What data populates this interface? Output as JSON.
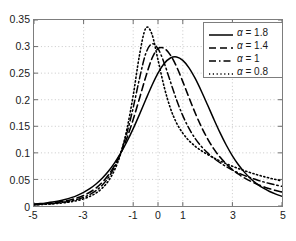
{
  "chart_data": {
    "type": "line",
    "title": "",
    "xlabel": "",
    "ylabel": "",
    "xlim": [
      -5,
      5
    ],
    "ylim": [
      0,
      0.35
    ],
    "grid": true,
    "legend_position": "top-right",
    "x_ticks": [
      "-5",
      "-3",
      "-1",
      "0",
      "1",
      "3",
      "5"
    ],
    "x_tick_values": [
      -5,
      -3,
      -1,
      0,
      1,
      3,
      5
    ],
    "y_ticks": [
      "0",
      "0.05",
      "0.1",
      "0.15",
      "0.2",
      "0.25",
      "0.3",
      "0.35"
    ],
    "y_tick_values": [
      0,
      0.05,
      0.1,
      0.15,
      0.2,
      0.25,
      0.3,
      0.35
    ],
    "series": [
      {
        "name": "α = 1.8",
        "legend_label": "α = 1.8",
        "alpha": 1.8,
        "style": "solid",
        "color": "#000000",
        "peak_x": 0.0,
        "peak_y": 0.283,
        "x": [
          -5,
          -4.75,
          -4.5,
          -4.25,
          -4,
          -3.75,
          -3.5,
          -3.25,
          -3,
          -2.75,
          -2.5,
          -2.25,
          -2,
          -1.75,
          -1.5,
          -1.25,
          -1,
          -0.75,
          -0.5,
          -0.25,
          0,
          0.25,
          0.5,
          0.75,
          1,
          1.25,
          1.5,
          1.75,
          2,
          2.25,
          2.5,
          2.75,
          3,
          3.25,
          3.5,
          3.75,
          4,
          4.25,
          4.5,
          4.75,
          5
        ],
        "y": [
          0.0035,
          0.0045,
          0.0058,
          0.0074,
          0.0095,
          0.0122,
          0.0157,
          0.0201,
          0.0257,
          0.0327,
          0.0415,
          0.0523,
          0.0655,
          0.0813,
          0.0999,
          0.1214,
          0.1456,
          0.172,
          0.1995,
          0.2263,
          0.25,
          0.268,
          0.2785,
          0.2805,
          0.274,
          0.26,
          0.24,
          0.216,
          0.19,
          0.1635,
          0.138,
          0.1148,
          0.0945,
          0.0772,
          0.0628,
          0.0509,
          0.0413,
          0.0335,
          0.0273,
          0.0223,
          0.0183
        ]
      },
      {
        "name": "α = 1.4",
        "legend_label": "α = 1.4",
        "alpha": 1.4,
        "style": "dashed",
        "color": "#000000",
        "peak_x": -0.2,
        "peak_y": 0.3,
        "x": [
          -5,
          -4.75,
          -4.5,
          -4.25,
          -4,
          -3.75,
          -3.5,
          -3.25,
          -3,
          -2.75,
          -2.5,
          -2.25,
          -2,
          -1.75,
          -1.5,
          -1.25,
          -1,
          -0.75,
          -0.5,
          -0.25,
          0,
          0.25,
          0.5,
          0.75,
          1,
          1.25,
          1.5,
          1.75,
          2,
          2.25,
          2.5,
          2.75,
          3,
          3.25,
          3.5,
          3.75,
          4,
          4.25,
          4.5,
          4.75,
          5
        ],
        "y": [
          0.003,
          0.0037,
          0.0046,
          0.0058,
          0.0073,
          0.0093,
          0.0119,
          0.0153,
          0.0198,
          0.0258,
          0.0338,
          0.0444,
          0.0583,
          0.0764,
          0.0995,
          0.1284,
          0.163,
          0.202,
          0.242,
          0.277,
          0.296,
          0.2965,
          0.284,
          0.262,
          0.234,
          0.204,
          0.175,
          0.149,
          0.1265,
          0.1075,
          0.092,
          0.0792,
          0.0686,
          0.0598,
          0.0524,
          0.0462,
          0.0409,
          0.0364,
          0.0325,
          0.0292,
          0.0263
        ]
      },
      {
        "name": "α = 1",
        "legend_label": "α = 1",
        "alpha": 1.0,
        "style": "dashdot",
        "color": "#000000",
        "peak_x": -0.3,
        "peak_y": 0.305,
        "x": [
          -5,
          -4.75,
          -4.5,
          -4.25,
          -4,
          -3.75,
          -3.5,
          -3.25,
          -3,
          -2.75,
          -2.5,
          -2.25,
          -2,
          -1.75,
          -1.5,
          -1.25,
          -1,
          -0.75,
          -0.5,
          -0.25,
          0,
          0.25,
          0.5,
          0.75,
          1,
          1.25,
          1.5,
          1.75,
          2,
          2.25,
          2.5,
          2.75,
          3,
          3.25,
          3.5,
          3.75,
          4,
          4.25,
          4.5,
          4.75,
          5
        ],
        "y": [
          0.0026,
          0.0032,
          0.0039,
          0.0048,
          0.006,
          0.0076,
          0.0097,
          0.0125,
          0.0163,
          0.0216,
          0.0289,
          0.0392,
          0.0535,
          0.0735,
          0.101,
          0.138,
          0.185,
          0.239,
          0.286,
          0.305,
          0.296,
          0.269,
          0.234,
          0.1995,
          0.17,
          0.146,
          0.127,
          0.112,
          0.1,
          0.09,
          0.0815,
          0.0742,
          0.0678,
          0.0622,
          0.0572,
          0.0528,
          0.0489,
          0.0454,
          0.0423,
          0.0395,
          0.037
        ]
      },
      {
        "name": "α = 0.8",
        "legend_label": "α = 0.8",
        "alpha": 0.8,
        "style": "dotted",
        "color": "#000000",
        "peak_x": -0.45,
        "peak_y": 0.335,
        "x": [
          -5,
          -4.75,
          -4.5,
          -4.25,
          -4,
          -3.75,
          -3.5,
          -3.25,
          -3,
          -2.75,
          -2.5,
          -2.25,
          -2,
          -1.75,
          -1.5,
          -1.25,
          -1,
          -0.75,
          -0.5,
          -0.25,
          0,
          0.25,
          0.5,
          0.75,
          1,
          1.25,
          1.5,
          1.75,
          2,
          2.25,
          2.5,
          2.75,
          3,
          3.25,
          3.5,
          3.75,
          4,
          4.25,
          4.5,
          4.75,
          5
        ],
        "y": [
          0.0022,
          0.0027,
          0.0033,
          0.004,
          0.005,
          0.0063,
          0.008,
          0.0103,
          0.0135,
          0.018,
          0.0243,
          0.0336,
          0.0472,
          0.0678,
          0.099,
          0.1455,
          0.208,
          0.283,
          0.334,
          0.324,
          0.275,
          0.224,
          0.184,
          0.156,
          0.137,
          0.123,
          0.1125,
          0.104,
          0.0968,
          0.0905,
          0.0848,
          0.0796,
          0.0748,
          0.0703,
          0.0662,
          0.0623,
          0.0588,
          0.0555,
          0.0525,
          0.0498,
          0.0473
        ]
      }
    ]
  }
}
